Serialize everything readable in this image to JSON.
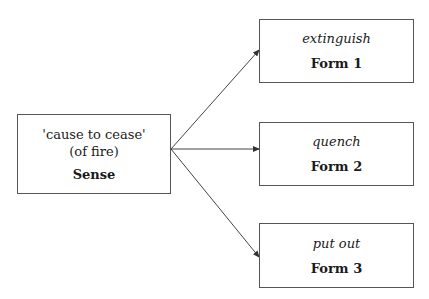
{
  "diagram": {
    "sense": {
      "gloss_line1": "'cause to cease'",
      "gloss_line2": "(of fire)",
      "label": "Sense"
    },
    "forms": [
      {
        "word": "extinguish",
        "label": "Form 1"
      },
      {
        "word": "quench",
        "label": "Form 2"
      },
      {
        "word": "put out",
        "label": "Form 3"
      }
    ],
    "edges": [
      {
        "from": "Sense",
        "to": "Form 1"
      },
      {
        "from": "Sense",
        "to": "Form 2"
      },
      {
        "from": "Sense",
        "to": "Form 3"
      }
    ],
    "colors": {
      "stroke": "#555555",
      "text": "#1a1a1a",
      "background": "#ffffff"
    }
  }
}
